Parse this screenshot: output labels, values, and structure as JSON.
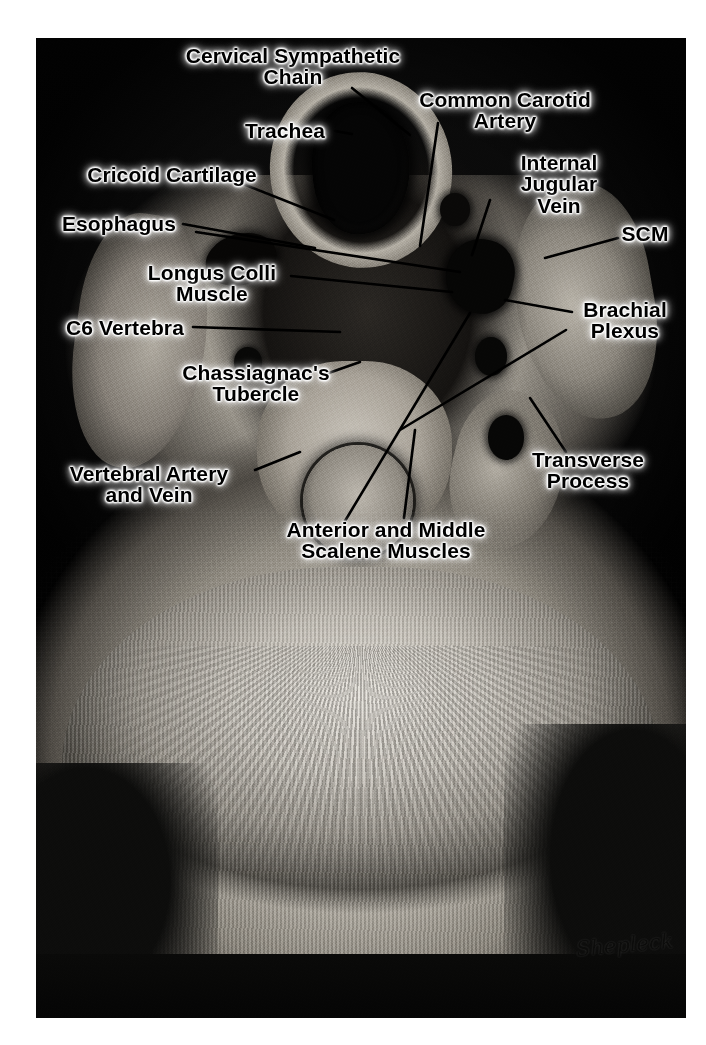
{
  "figure": {
    "kind": "anatomical-cross-section",
    "view": "axial section of the neck at the C6 vertebral level",
    "signature": "Shepleck",
    "background_color": "#ffffff",
    "label_text_color": "#000000",
    "label_glow_color": "#ffffff"
  },
  "labels": [
    {
      "id": "cervical-sympathetic-chain",
      "text": "Cervical Sympathetic\nChain",
      "x": 293,
      "y": 66,
      "align": "center"
    },
    {
      "id": "trachea",
      "text": "Trachea",
      "x": 285,
      "y": 131,
      "align": "center"
    },
    {
      "id": "cricoid-cartilage",
      "text": "Cricoid Cartilage",
      "x": 172,
      "y": 175,
      "align": "center"
    },
    {
      "id": "esophagus",
      "text": "Esophagus",
      "x": 119,
      "y": 224,
      "align": "center"
    },
    {
      "id": "longus-colli-muscle",
      "text": "Longus Colli\nMuscle",
      "x": 212,
      "y": 283,
      "align": "center"
    },
    {
      "id": "c6-vertebra",
      "text": "C6 Vertebra",
      "x": 125,
      "y": 328,
      "align": "center"
    },
    {
      "id": "chassiagnacs-tubercle",
      "text": "Chassiagnac's\nTubercle",
      "x": 256,
      "y": 383,
      "align": "center"
    },
    {
      "id": "vertebral-artery-and-vein",
      "text": "Vertebral Artery\nand Vein",
      "x": 149,
      "y": 484,
      "align": "center"
    },
    {
      "id": "anterior-and-middle-scalene-muscles",
      "text": "Anterior and Middle\nScalene Muscles",
      "x": 386,
      "y": 540,
      "align": "center"
    },
    {
      "id": "common-carotid-artery",
      "text": "Common Carotid\nArtery",
      "x": 505,
      "y": 110,
      "align": "center"
    },
    {
      "id": "internal-jugular-vein",
      "text": "Internal Jugular\nVein",
      "x": 559,
      "y": 184,
      "align": "center"
    },
    {
      "id": "scm",
      "text": "SCM",
      "x": 645,
      "y": 234,
      "align": "center"
    },
    {
      "id": "brachial-plexus",
      "text": "Brachial\nPlexus",
      "x": 625,
      "y": 320,
      "align": "center"
    },
    {
      "id": "transverse-process",
      "text": "Transverse\nProcess",
      "x": 588,
      "y": 470,
      "align": "center"
    }
  ],
  "leader_lines": [
    {
      "id": "leader-cervical-sympathetic-chain",
      "from": [
        352,
        88
      ],
      "to": [
        410,
        135
      ]
    },
    {
      "id": "leader-trachea",
      "from": [
        335,
        131
      ],
      "to": [
        352,
        134
      ]
    },
    {
      "id": "leader-cricoid-cartilage",
      "from": [
        243,
        184
      ],
      "to": [
        334,
        220
      ]
    },
    {
      "id": "leader-esophagus",
      "from": [
        183,
        224
      ],
      "to": [
        315,
        248
      ]
    },
    {
      "id": "leader-esophagus-2",
      "from": [
        196,
        232
      ],
      "to": [
        460,
        272
      ]
    },
    {
      "id": "leader-longus-colli",
      "from": [
        291,
        276
      ],
      "to": [
        452,
        292
      ]
    },
    {
      "id": "leader-c6-vertebra",
      "from": [
        193,
        327
      ],
      "to": [
        340,
        332
      ]
    },
    {
      "id": "leader-chassiagnacs-tubercle",
      "from": [
        323,
        375
      ],
      "to": [
        360,
        362
      ]
    },
    {
      "id": "leader-vertebral-artery",
      "from": [
        255,
        470
      ],
      "to": [
        300,
        452
      ]
    },
    {
      "id": "leader-scalene-a",
      "from": [
        345,
        521
      ],
      "to": [
        470,
        313
      ]
    },
    {
      "id": "leader-scalene-b",
      "from": [
        404,
        518
      ],
      "to": [
        415,
        430
      ]
    },
    {
      "id": "leader-common-carotid",
      "from": [
        438,
        123
      ],
      "to": [
        420,
        246
      ]
    },
    {
      "id": "leader-internal-jugular",
      "from": [
        490,
        200
      ],
      "to": [
        472,
        255
      ]
    },
    {
      "id": "leader-scm",
      "from": [
        618,
        238
      ],
      "to": [
        545,
        258
      ]
    },
    {
      "id": "leader-brachial-plexus",
      "from": [
        572,
        312
      ],
      "to": [
        505,
        300
      ]
    },
    {
      "id": "leader-brachial-plexus-2",
      "from": [
        566,
        330
      ],
      "to": [
        400,
        430
      ]
    },
    {
      "id": "leader-transverse-process",
      "from": [
        566,
        452
      ],
      "to": [
        530,
        398
      ]
    }
  ]
}
